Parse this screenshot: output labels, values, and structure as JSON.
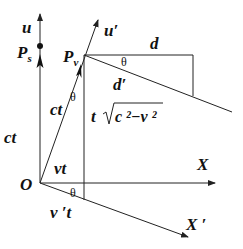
{
  "diagram": {
    "title": "",
    "colors": {
      "line": "#222222",
      "text": "#111111",
      "background": "#ffffff"
    },
    "labels": {
      "u": "u",
      "Ps_main": "P",
      "Ps_sub": "s",
      "Pv_main": "P",
      "Pv_sub": "v",
      "u_prime": "u′",
      "d": "d",
      "d_prime": "d′",
      "theta_top": "θ",
      "theta_mid": "θ",
      "theta_bottom": "θ",
      "ct_left": "ct",
      "ct_diag": "ct",
      "t_sqrt_t": "t",
      "t_sqrt_expr": "c ²−v ²",
      "vt": "vt",
      "v_prime_t": "v ′t",
      "O": "O",
      "X": "X",
      "X_prime": "X ′"
    }
  }
}
